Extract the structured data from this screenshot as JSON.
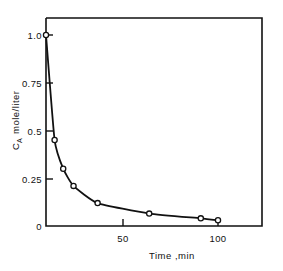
{
  "chart_data": {
    "type": "line",
    "title": "",
    "subtitle": "",
    "xlabel": "Time ,min",
    "ylabel": "C",
    "ylabel_sub": "A",
    "ylabel_units": "mole/liter",
    "xlim": [
      0,
      115
    ],
    "ylim": [
      0,
      1.1
    ],
    "xticks": [
      50,
      100
    ],
    "xtick_labels": [
      "50",
      "100"
    ],
    "yticks": [
      0,
      0.25,
      0.5,
      0.75,
      1.0
    ],
    "ytick_labels": [
      "0",
      "0.25",
      "0.5",
      "0.75",
      "1.0"
    ],
    "grid": false,
    "legend": null,
    "marker": "open-circle",
    "line_color": "#111111",
    "marker_face_color": "#ffffff",
    "series": [
      {
        "name": "C_A vs time",
        "x": [
          0,
          5,
          10,
          16,
          30,
          60,
          90,
          100
        ],
        "y": [
          1.0,
          0.45,
          0.3,
          0.21,
          0.12,
          0.065,
          0.04,
          0.03
        ]
      }
    ]
  },
  "axis_labels": {
    "y_tick_1": "1.0",
    "y_tick_075": "0.75",
    "y_tick_05": "0.5",
    "y_tick_025": "0.25",
    "y_tick_0": "0",
    "x_tick_50": "50",
    "x_tick_100": "100",
    "x_axis_title": "Time ,min",
    "y_axis_title_main": "C",
    "y_axis_title_subscript": "A",
    "y_axis_title_units": "mole/liter"
  }
}
